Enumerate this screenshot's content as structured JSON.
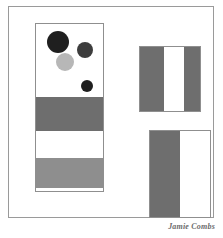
{
  "artwork": {
    "title": "Abstract Geometric Composition",
    "signature": "Jamie Combs",
    "background_color": "#ffffff",
    "frame": {
      "border_color": "#9a9a9a",
      "x": 8,
      "y": 6,
      "width": 206,
      "height": 212
    },
    "left_panel": {
      "name": "left-vertical-panel",
      "border_color": "#8f8f8f",
      "x": 35,
      "y": 23,
      "width": 69,
      "height": 169,
      "bands": [
        {
          "label": "white-field-top",
          "color": "#ffffff",
          "top": 0,
          "height": 73
        },
        {
          "label": "dark-gray-band",
          "color": "#6e6e6e",
          "top": 73,
          "height": 34
        },
        {
          "label": "white-band",
          "color": "#ffffff",
          "top": 107,
          "height": 27
        },
        {
          "label": "light-gray-band",
          "color": "#8e8e8e",
          "top": 134,
          "height": 30
        },
        {
          "label": "white-strip-bottom",
          "color": "#ffffff",
          "top": 164,
          "height": 5
        }
      ],
      "circles": [
        {
          "label": "large-black-circle",
          "color": "#1f1f1f",
          "cx": 22,
          "cy": 18,
          "r": 11
        },
        {
          "label": "medium-dark-gray-circle",
          "color": "#3d3d3d",
          "cx": 49,
          "cy": 26,
          "r": 8
        },
        {
          "label": "light-gray-circle",
          "color": "#b7b7b7",
          "cx": 29,
          "cy": 38,
          "r": 9
        },
        {
          "label": "small-black-circle",
          "color": "#1f1f1f",
          "cx": 51,
          "cy": 62,
          "r": 6
        }
      ]
    },
    "top_right_block": {
      "name": "top-right-striped-block",
      "border_color": "#8f8f8f",
      "x": 139,
      "y": 46,
      "width": 62,
      "height": 66,
      "stripes": [
        {
          "label": "gray-stripe-left",
          "color": "#6e6e6e",
          "width": 24
        },
        {
          "label": "white-stripe-center",
          "color": "#ffffff",
          "width": 20
        },
        {
          "label": "gray-stripe-right",
          "color": "#6e6e6e",
          "width": 16
        }
      ]
    },
    "bottom_right_block": {
      "name": "bottom-right-half-block",
      "border_color": "#8f8f8f",
      "x": 149,
      "y": 130,
      "width": 62,
      "height": 88,
      "stripes": [
        {
          "label": "gray-stripe-left",
          "color": "#6e6e6e",
          "width": 30
        },
        {
          "label": "white-stripe-right",
          "color": "#ffffff",
          "width": 30
        }
      ]
    }
  }
}
